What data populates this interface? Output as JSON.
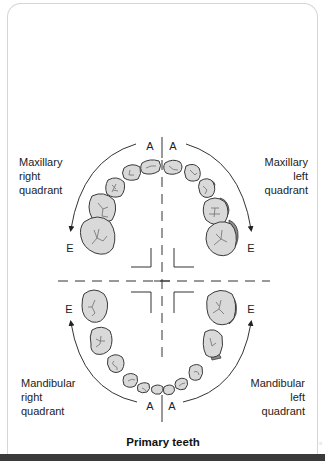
{
  "diagram": {
    "title": "Primary teeth",
    "quadrants": {
      "maxillary_right": {
        "lines": [
          "Maxillary",
          "right",
          "quadrant"
        ]
      },
      "maxillary_left": {
        "lines": [
          "Maxillary",
          "left",
          "quadrant"
        ]
      },
      "mandibular_right": {
        "lines": [
          "Mandibular",
          "right",
          "quadrant"
        ]
      },
      "mandibular_left": {
        "lines": [
          "Mandibular",
          "left",
          "quadrant"
        ]
      }
    },
    "letters": {
      "upper_right_start": "A",
      "upper_left_start": "A",
      "upper_right_end": "E",
      "upper_left_end": "E",
      "lower_right_end": "E",
      "lower_left_end": "E",
      "lower_right_start": "A",
      "lower_left_start": "A"
    },
    "side_note": "©"
  },
  "colors": {
    "tooth_fill": "#d9d9d9",
    "tooth_outline": "#3a3a3a",
    "shade": "#8c8c8c",
    "bottom_bar": "#3a3a3a"
  }
}
